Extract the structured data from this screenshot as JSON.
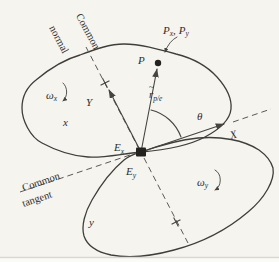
{
  "figure": {
    "colors": {
      "background": "#f5f4ef",
      "outline": "#3f3e3a",
      "dashed_line": "#5a5955",
      "text": "#2e2d2a",
      "scan_edge": "#d9d8d3"
    },
    "labels": {
      "common_normal_line1": "Common",
      "common_normal_line2": "normal",
      "common_tangent_line1": "Common",
      "common_tangent_line2": "tangent",
      "omega_x": {
        "main": "ω",
        "sub": "x"
      },
      "omega_y": {
        "main": "ω",
        "sub": "y"
      },
      "body_x": "x",
      "body_y": "y",
      "point_P": "P",
      "pair_label": {
        "P1": "P",
        "P1_sub": "x",
        "separator": ",",
        "P2": "P",
        "P2_sub": "y"
      },
      "r_vector": {
        "accent": "~",
        "main": "r",
        "sub": "p/e"
      },
      "theta": "θ",
      "axis_X": "X",
      "axis_Y": "Y",
      "E_x": {
        "main": "E",
        "sub": "x"
      },
      "E_y": {
        "main": "E",
        "sub": "y"
      }
    }
  }
}
